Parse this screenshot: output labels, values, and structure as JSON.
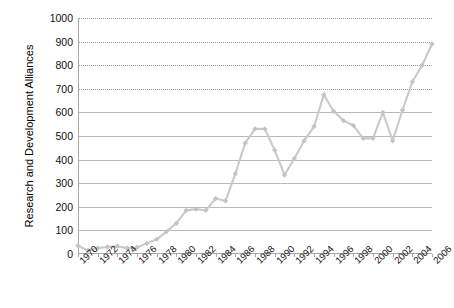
{
  "chart_data": {
    "type": "line",
    "title": "",
    "xlabel": "",
    "ylabel": "Research and Development Alliances",
    "ylim": [
      0,
      1000
    ],
    "ytick_values": [
      0,
      100,
      200,
      300,
      400,
      500,
      600,
      700,
      800,
      900,
      1000
    ],
    "ytick_labels": [
      "0",
      "100",
      "200",
      "300",
      "400",
      "500",
      "600",
      "700",
      "800",
      "900",
      "1000"
    ],
    "xlim": [
      1970,
      2006
    ],
    "xtick_values": [
      1970,
      1972,
      1974,
      1976,
      1978,
      1980,
      1982,
      1984,
      1986,
      1988,
      1990,
      1992,
      1994,
      1996,
      1998,
      2000,
      2002,
      2004,
      2006
    ],
    "xtick_labels": [
      "1970",
      "1972",
      "1974",
      "1976",
      "1978",
      "1980",
      "1982",
      "1984",
      "1986",
      "1988",
      "1990",
      "1992",
      "1994",
      "1996",
      "1998",
      "2000",
      "2002",
      "2004",
      "2006"
    ],
    "grid": true,
    "legend": false,
    "marker": "diamond",
    "line_color": "#c9c9c9",
    "marker_color": "#c4c4c4",
    "x": [
      1970,
      1971,
      1972,
      1973,
      1974,
      1975,
      1976,
      1977,
      1978,
      1979,
      1980,
      1981,
      1982,
      1983,
      1984,
      1985,
      1986,
      1987,
      1988,
      1989,
      1990,
      1991,
      1992,
      1993,
      1994,
      1995,
      1996,
      1997,
      1998,
      1999,
      2000,
      2001,
      2002,
      2003,
      2004,
      2005,
      2006
    ],
    "values": [
      35,
      15,
      25,
      30,
      33,
      25,
      28,
      45,
      62,
      95,
      130,
      185,
      190,
      185,
      235,
      225,
      340,
      470,
      530,
      530,
      440,
      335,
      405,
      480,
      540,
      675,
      605,
      565,
      545,
      490,
      490,
      600,
      480,
      610,
      730,
      800,
      890
    ],
    "series": [
      {
        "name": "Research and Development Alliances",
        "values": [
          35,
          15,
          25,
          30,
          33,
          25,
          28,
          45,
          62,
          95,
          130,
          185,
          190,
          185,
          235,
          225,
          340,
          470,
          530,
          530,
          440,
          335,
          405,
          480,
          540,
          675,
          605,
          565,
          545,
          490,
          490,
          600,
          480,
          610,
          730,
          800,
          890
        ]
      }
    ]
  }
}
